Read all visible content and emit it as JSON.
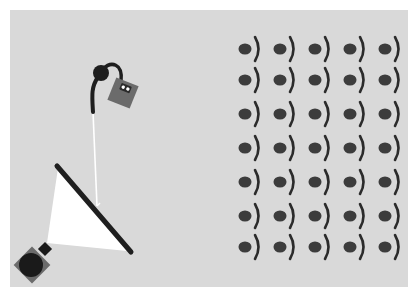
{
  "scene": {
    "background": "#d9d9d9",
    "border_color": "#ffffff",
    "panel": {
      "x": 10,
      "y": 10,
      "width": 398,
      "height": 277
    }
  },
  "colors": {
    "dot": "#3c3c3c",
    "arc": "#2b2b2b",
    "cable": "#1e1e1e",
    "device_body": "#6b6b6b",
    "device_display": "#2a2a2a",
    "device_leds": "#ffffff",
    "beam": "#ffffff",
    "mirror": "#1f1f1f",
    "projector_body": "#6b6b6b",
    "projector_lens": "#1a1a1a"
  },
  "lamp": {
    "head": {
      "cx": 101,
      "cy": 73,
      "r": 8
    },
    "device": {
      "cx": 123,
      "cy": 93,
      "size": 24,
      "rotation": 22
    },
    "string_line": {
      "x1": 93,
      "y1": 112,
      "x2": 97,
      "y2": 206
    }
  },
  "mirror": {
    "x1": 57,
    "y1": 166,
    "x2": 131,
    "y2": 252,
    "width": 5
  },
  "beam_polygon": "58,168 47,243 127,251",
  "projector": {
    "cx": 32,
    "cy": 265,
    "size": 26,
    "lens_r": 12,
    "nozzle": {
      "cx": 45,
      "cy": 249,
      "size": 10
    }
  },
  "grid": {
    "columns": [
      245,
      280,
      315,
      350,
      385
    ],
    "rows": [
      49,
      80,
      114,
      148,
      182,
      216,
      247
    ],
    "dot_rx": 6.5,
    "dot_ry": 5.5,
    "arc_offset_x": 12,
    "arc_half_height": 12
  }
}
